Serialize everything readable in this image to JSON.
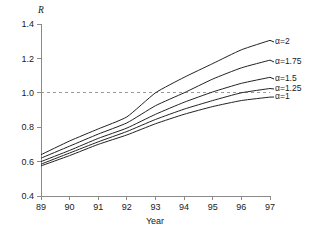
{
  "chart_data": {
    "type": "line",
    "title": "",
    "xlabel": "Year",
    "ylabel": "R",
    "xlim": [
      89,
      97
    ],
    "ylim": [
      0.4,
      1.4
    ],
    "grid": "dashed-horizontal-at-1.0",
    "gridlines": [
      1.0
    ],
    "legend_position": "right-inline-labels",
    "x_ticks": [
      "89",
      "90",
      "91",
      "92",
      "93",
      "94",
      "95",
      "96",
      "97"
    ],
    "y_ticks": [
      "0.4",
      "0.6",
      "0.8",
      "1.0",
      "1.2",
      "1.4"
    ],
    "x": [
      89,
      90,
      91,
      92,
      93,
      94,
      95,
      96,
      97
    ],
    "series": [
      {
        "name": "α=2",
        "label": "α=2",
        "values": [
          0.64,
          0.72,
          0.79,
          0.86,
          1.0,
          1.09,
          1.17,
          1.25,
          1.305
        ]
      },
      {
        "name": "α=1.75",
        "label": "α=1.75",
        "values": [
          0.62,
          0.69,
          0.76,
          0.825,
          0.925,
          1.0,
          1.08,
          1.145,
          1.19
        ]
      },
      {
        "name": "α=1.5",
        "label": "α=1.5",
        "values": [
          0.6,
          0.665,
          0.735,
          0.795,
          0.875,
          0.945,
          1.005,
          1.055,
          1.09
        ]
      },
      {
        "name": "α=1.25",
        "label": "α=1.25",
        "values": [
          0.585,
          0.65,
          0.715,
          0.775,
          0.845,
          0.905,
          0.955,
          1.0,
          1.025
        ]
      },
      {
        "name": "α=1",
        "label": "α=1",
        "values": [
          0.575,
          0.635,
          0.7,
          0.755,
          0.82,
          0.875,
          0.92,
          0.955,
          0.975
        ]
      }
    ]
  },
  "axes": {
    "y_title": "R",
    "x_title": "Year"
  }
}
